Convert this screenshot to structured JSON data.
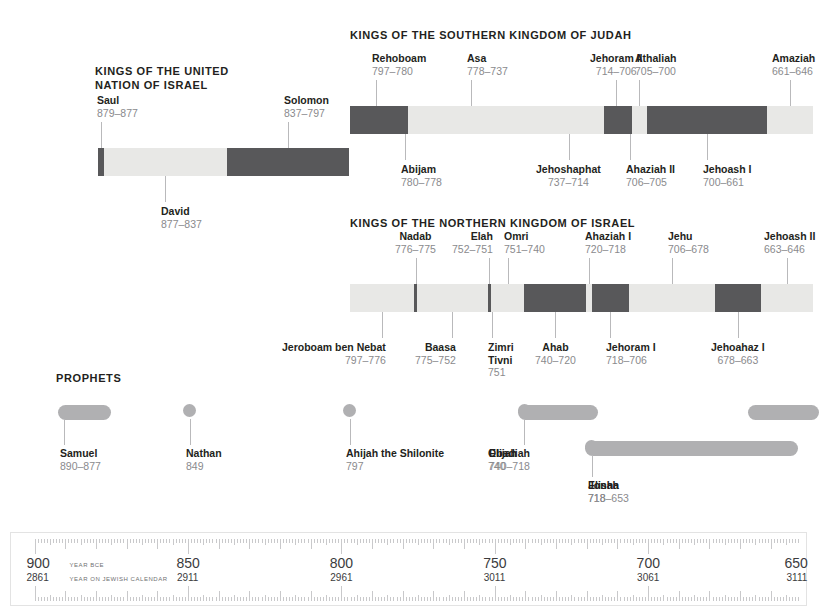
{
  "meta": {
    "palette": {
      "dark_segment": "#58585a",
      "light_segment": "#e8e8e6",
      "prophet": "#b0b0b2",
      "year_text": "#8a8a8d",
      "name_text": "#231f20",
      "leader_line": "#b9b9bb"
    }
  },
  "sections": {
    "united": {
      "title": "KINGS OF THE UNITED\nNATION OF ISRAEL"
    },
    "judah": {
      "title": "KINGS OF THE SOUTHERN KINGDOM OF JUDAH"
    },
    "israel": {
      "title": "KINGS OF THE NORTHERN KINGDOM OF ISRAEL"
    },
    "prophets": {
      "title": "PROPHETS"
    }
  },
  "united_kings": [
    {
      "name": "Saul",
      "years": "879–877",
      "start": 879,
      "end": 877,
      "shade": "dark",
      "side": "above",
      "align": "l"
    },
    {
      "name": "David",
      "years": "877–837",
      "start": 877,
      "end": 837,
      "shade": "light",
      "side": "below",
      "align": "l"
    },
    {
      "name": "Solomon",
      "years": "837–797",
      "start": 837,
      "end": 797,
      "shade": "dark",
      "side": "above",
      "align": "l"
    }
  ],
  "judah_kings": [
    {
      "name": "Rehoboam",
      "years": "797–780",
      "start": 797,
      "end": 780,
      "shade": "dark",
      "side": "above",
      "align": "l"
    },
    {
      "name": "Abijam",
      "years": "780–778",
      "start": 780,
      "end": 778,
      "shade": "dark",
      "side": "below",
      "align": "l"
    },
    {
      "name": "Asa",
      "years": "778–737",
      "start": 778,
      "end": 737,
      "shade": "light",
      "side": "above",
      "align": "l"
    },
    {
      "name": "Jehoshaphat",
      "years": "737–714",
      "start": 737,
      "end": 714,
      "shade": "light",
      "side": "below",
      "align": "c"
    },
    {
      "name": "Jehoram II",
      "years": "714–706",
      "start": 714,
      "end": 706,
      "shade": "dark",
      "side": "above",
      "align": "c"
    },
    {
      "name": "Ahaziah II",
      "years": "706–705",
      "start": 706,
      "end": 705,
      "shade": "dark",
      "side": "below",
      "align": "l"
    },
    {
      "name": "Athaliah",
      "years": "705–700",
      "start": 705,
      "end": 700,
      "shade": "light",
      "side": "above",
      "align": "l"
    },
    {
      "name": "Jehoash I",
      "years": "700–661",
      "start": 700,
      "end": 661,
      "shade": "dark",
      "side": "below",
      "align": "l"
    },
    {
      "name": "Amaziah",
      "years": "661–646",
      "start": 661,
      "end": 646,
      "shade": "light",
      "side": "above",
      "align": "l"
    }
  ],
  "israel_kings": [
    {
      "name": "Jeroboam ben Nebat",
      "years": "797–776",
      "start": 797,
      "end": 776,
      "shade": "light",
      "side": "below",
      "align": "r"
    },
    {
      "name": "Nadab",
      "years": "776–775",
      "start": 776,
      "end": 775,
      "shade": "dark",
      "side": "above",
      "align": "c"
    },
    {
      "name": "Baasa",
      "years": "775–752",
      "start": 775,
      "end": 752,
      "shade": "light",
      "side": "below",
      "align": "r"
    },
    {
      "name": "Elah",
      "years": "752–751",
      "start": 752,
      "end": 751,
      "shade": "dark",
      "side": "above",
      "align": "r"
    },
    {
      "name": "Zimri\nTivni",
      "years": "751",
      "start": 751,
      "end": 751,
      "shade": "dark",
      "side": "below",
      "align": "l"
    },
    {
      "name": "Omri",
      "years": "751–740",
      "start": 751,
      "end": 740,
      "shade": "light",
      "side": "above",
      "align": "l"
    },
    {
      "name": "Ahab",
      "years": "740–720",
      "start": 740,
      "end": 720,
      "shade": "dark",
      "side": "below",
      "align": "c"
    },
    {
      "name": "Ahaziah I",
      "years": "720–718",
      "start": 720,
      "end": 718,
      "shade": "light",
      "side": "above",
      "align": "l"
    },
    {
      "name": "Jehoram I",
      "years": "718–706",
      "start": 718,
      "end": 706,
      "shade": "dark",
      "side": "below",
      "align": "l"
    },
    {
      "name": "Jehu",
      "years": "706–678",
      "start": 706,
      "end": 678,
      "shade": "light",
      "side": "above",
      "align": "l"
    },
    {
      "name": "Jehoahaz I",
      "years": "678–663",
      "start": 678,
      "end": 663,
      "shade": "dark",
      "side": "below",
      "align": "c"
    },
    {
      "name": "Jehoash II",
      "years": "663–646",
      "start": 663,
      "end": 646,
      "shade": "light",
      "side": "above",
      "align": "l"
    }
  ],
  "prophets": [
    {
      "name": "Samuel",
      "years": "890–877",
      "start": 890,
      "end": 877,
      "row": 0,
      "shape": "bar"
    },
    {
      "name": "Nathan",
      "years": "849",
      "start": 849,
      "end": 849,
      "row": 0,
      "shape": "dot"
    },
    {
      "name": "Ahijah the Shilonite",
      "years": "797",
      "start": 797,
      "end": 797,
      "row": 0,
      "shape": "dot"
    },
    {
      "name": "Obadiah",
      "years": "740",
      "start": 740,
      "end": 740,
      "row": 0,
      "shape": "bar"
    },
    {
      "name": "Elijah",
      "years": "740–718",
      "start": 740,
      "end": 718,
      "row": 0,
      "shape": "bar"
    },
    {
      "name": "Jonah",
      "years": "718",
      "start": 718,
      "end": 718,
      "row": 1,
      "shape": "bar"
    },
    {
      "name": "Elisha",
      "years": "718–653",
      "start": 718,
      "end": 653,
      "row": 1,
      "shape": "bar"
    },
    {
      "name": "Amos",
      "years": "",
      "start": 665,
      "end": 646,
      "row": 0,
      "shape": "bar"
    }
  ],
  "axis": {
    "caption_bce": "YEAR BCE",
    "caption_jewish": "YEAR ON JEWISH CALENDAR",
    "ticks": [
      {
        "bce": "900",
        "jewish": "2861"
      },
      {
        "bce": "850",
        "jewish": "2911"
      },
      {
        "bce": "800",
        "jewish": "2961"
      },
      {
        "bce": "750",
        "jewish": "3011"
      },
      {
        "bce": "700",
        "jewish": "3061"
      },
      {
        "bce": "650",
        "jewish": "3111"
      }
    ],
    "range": {
      "from": 900,
      "to": 650
    }
  }
}
